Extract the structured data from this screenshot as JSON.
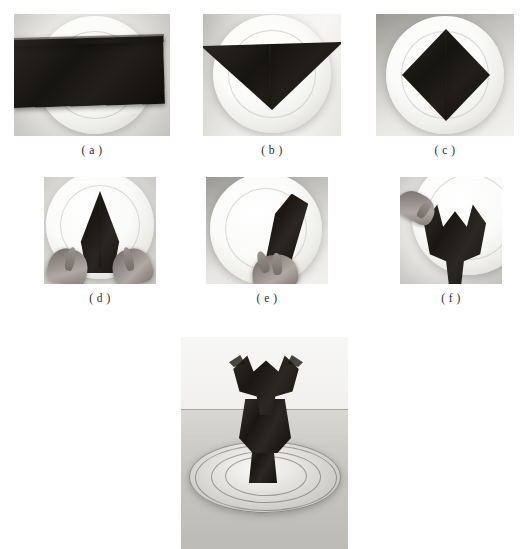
{
  "page": {
    "background_color": "#ffffff",
    "width": 528,
    "height": 549,
    "cut_off_header_text": "····· ··· ···   ····"
  },
  "figure": {
    "palette": {
      "napkin": "#17150f",
      "plate": "#fbfbfa",
      "background": "#ffffff",
      "table": "#c9c7c2",
      "caption_text": "#2b2b2b"
    },
    "panels": [
      {
        "id": "a",
        "caption": "( a )",
        "alt": "Black napkin laid as a wide horizontal band across a round white plate",
        "row": 1,
        "column": 1
      },
      {
        "id": "b",
        "caption": "( b )",
        "alt": "Napkin folded into a downward pointing triangle on the white plate",
        "row": 1,
        "column": 2
      },
      {
        "id": "c",
        "caption": "( c )",
        "alt": "Napkin folded into a diamond square resting centred on the white plate",
        "row": 1,
        "column": 3
      },
      {
        "id": "d",
        "caption": "( d )",
        "alt": "Two hands pinching the napkin into a tall narrow upward spire on the plate",
        "row": 2,
        "column": 1
      },
      {
        "id": "e",
        "caption": "( e )",
        "alt": "A hand rolling the folded napkin upright on the plate",
        "row": 2,
        "column": 2
      },
      {
        "id": "f",
        "caption": "( f )",
        "alt": "A hand shaping the napkin into a bird form with two raised wings",
        "row": 2,
        "column": 3
      },
      {
        "id": "final",
        "caption": "",
        "alt": "Finished black napkin sculpture standing upright on a clear glass charger plate",
        "row": 3,
        "column": 0
      }
    ]
  }
}
